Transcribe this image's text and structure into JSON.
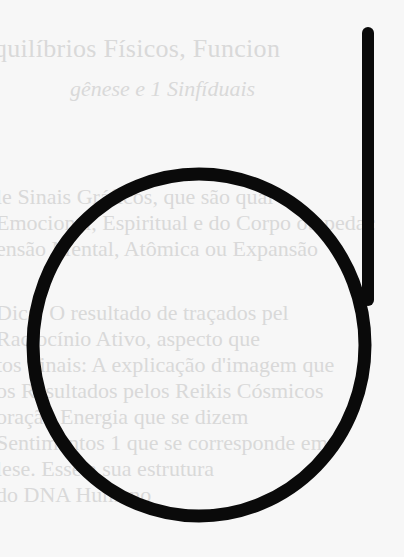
{
  "page": {
    "background_color": "#f7f7f7",
    "faded_text_color": "#d9d9d9"
  },
  "faded_text": {
    "heading": "quilíbrios Físicos, Funcion",
    "subheading": "gênese e 1 Sinfíduais",
    "paragraph_1": [
      "le Sinais Gráficos, que são qual",
      "Emocional, Espiritual e do Corpo ou pedaç",
      "ensão Mental, Atômica ou Expansão"
    ],
    "paragraph_2": [
      "Dica: O resultado de traçados pel",
      "Raciocínio Ativo, aspecto que",
      "tos Sinais: A explicação d'imagem que",
      "os Resultados pelos Reikis Cósmicos",
      "oração Energia que se dizem",
      "Sentimentos 1 que se corresponde em",
      "lese. Esse a sua estrutura",
      "do DNA Humano"
    ]
  },
  "symbol": {
    "name": "d-shaped-sign",
    "stroke_color": "#0a0a0a",
    "stroke_width": 13,
    "circle": {
      "cx": 199,
      "cy": 345,
      "rx": 166,
      "ry": 171
    },
    "stem": {
      "x": 368,
      "y_top": 33,
      "y_bottom": 300
    }
  }
}
